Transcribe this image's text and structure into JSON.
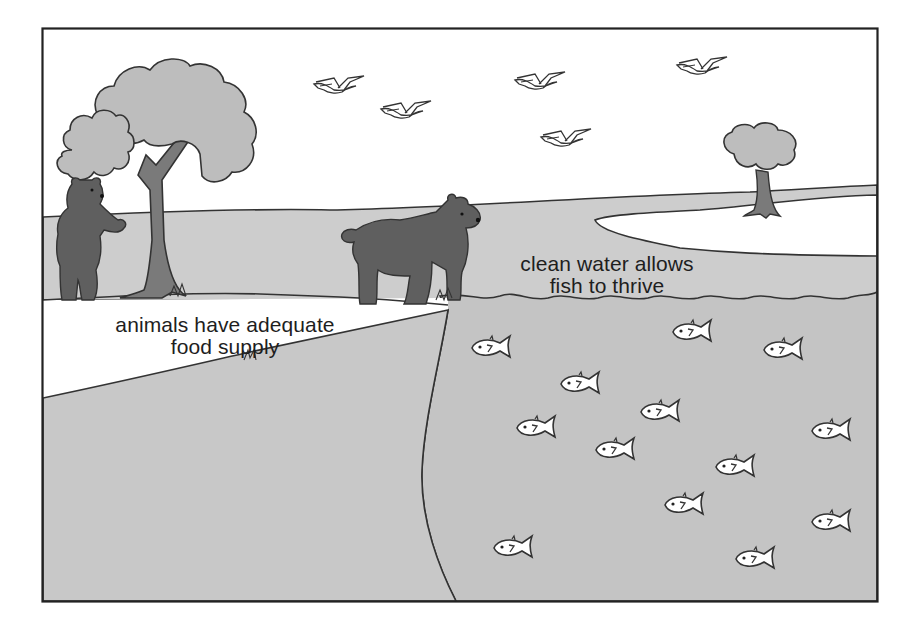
{
  "illustration": {
    "title": "Healthy ecosystem: bears, birds, trees and fish",
    "colors": {
      "frame": "#222222",
      "sky": "#ffffff",
      "water": "#c4c4c4",
      "grass": "#cdcdcd",
      "tree_foliage": "#bdbdbd",
      "tree_trunk": "#7a7a7a",
      "bear": "#5f5f5f",
      "fish": "#ffffff",
      "outline": "#333333"
    },
    "labels": {
      "food": {
        "line1": "animals have adequate",
        "line2": "food supply"
      },
      "water": {
        "line1": "clean water allows",
        "line2": "fish to thrive"
      }
    },
    "elements": {
      "birds": 5,
      "fish": 12,
      "bears": 2,
      "trees": 2
    }
  }
}
